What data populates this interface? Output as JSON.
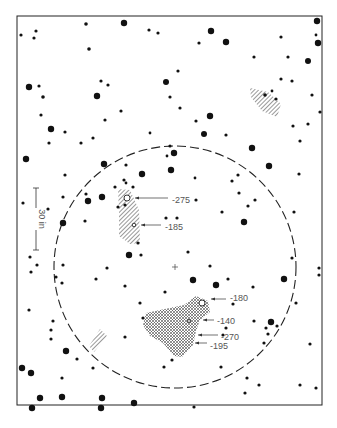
{
  "figure": {
    "frame": {
      "x": 17,
      "y": 16,
      "width": 305,
      "height": 389
    },
    "field_circle": {
      "cx": 175,
      "cy": 267,
      "r": 121
    },
    "center_mark": {
      "x": 175,
      "y": 267
    },
    "scale_bar": {
      "x": 36,
      "y1": 188,
      "y2": 250,
      "label": "30 in"
    },
    "hatched_regions": [
      {
        "name": "upper-right-patch",
        "style": "diagonal",
        "points": "250,88 268,92 281,104 277,117 262,111 251,97"
      },
      {
        "name": "left-streak",
        "style": "diagonal",
        "points": "118,189 130,190 139,210 140,243 130,244 119,236 119,212"
      },
      {
        "name": "lower-left-patch",
        "style": "diagonal",
        "points": "89,346 100,329 107,336 94,352"
      },
      {
        "name": "lower-center-region",
        "style": "crosshatch",
        "points": "146,313 160,310 184,305 196,296 208,301 210,312 200,320 196,331 193,345 182,357 174,356 163,343 150,336 143,325"
      }
    ],
    "annotations": [
      {
        "label": "-275",
        "tx": 172,
        "ty": 200,
        "ax": 127,
        "ay": 198,
        "lx1": 135,
        "lx2": 168
      },
      {
        "label": "-185",
        "tx": 165,
        "ty": 227,
        "ax": 135,
        "ay": 225,
        "lx1": 141,
        "lx2": 161
      },
      {
        "label": "-180",
        "tx": 230,
        "ty": 298,
        "ax": 207,
        "ay": 299,
        "lx1": 211,
        "lx2": 226
      },
      {
        "label": "-140",
        "tx": 217,
        "ty": 321,
        "ax": 201,
        "ay": 320,
        "lx1": 203,
        "lx2": 214
      },
      {
        "label": "-270",
        "tx": 221,
        "ty": 337,
        "ax": 196,
        "ay": 335,
        "lx1": 198,
        "lx2": 218
      },
      {
        "label": "-195",
        "tx": 210,
        "ty": 346,
        "ax": 193,
        "ay": 343,
        "lx1": 195,
        "lx2": 207
      }
    ],
    "open_circles": [
      {
        "x": 127,
        "y": 198,
        "r": 3
      },
      {
        "x": 134,
        "y": 225,
        "r": 1.8
      },
      {
        "x": 202,
        "y": 303,
        "r": 3
      },
      {
        "x": 189,
        "y": 321,
        "r": 1.5
      }
    ],
    "stars": [
      [
        86,
        24,
        1.8
      ],
      [
        124,
        23,
        3.2
      ],
      [
        149,
        30,
        1.6
      ],
      [
        158,
        33,
        1.6
      ],
      [
        21,
        35,
        1.6
      ],
      [
        36,
        31,
        1.6
      ],
      [
        34,
        38,
        1.6
      ],
      [
        211,
        31,
        3.2
      ],
      [
        199,
        43,
        1.6
      ],
      [
        226,
        42,
        3.2
      ],
      [
        89,
        49,
        1.8
      ],
      [
        317,
        21,
        3.2
      ],
      [
        316,
        35,
        1.4
      ],
      [
        318,
        43,
        3.2
      ],
      [
        281,
        37,
        1.6
      ],
      [
        254,
        57,
        1.6
      ],
      [
        288,
        57,
        1.6
      ],
      [
        308,
        61,
        3
      ],
      [
        29,
        87,
        3.2
      ],
      [
        39,
        86,
        1.6
      ],
      [
        43,
        97,
        1.8
      ],
      [
        97,
        96,
        3.2
      ],
      [
        101,
        81,
        1.6
      ],
      [
        108,
        85,
        1.6
      ],
      [
        166,
        82,
        3
      ],
      [
        178,
        71,
        1.6
      ],
      [
        170,
        97,
        1.6
      ],
      [
        281,
        79,
        1.6
      ],
      [
        292,
        81,
        1.6
      ],
      [
        265,
        95,
        1.8
      ],
      [
        272,
        91,
        1.4
      ],
      [
        276,
        99,
        1.6
      ],
      [
        312,
        95,
        1.6
      ],
      [
        320,
        112,
        1.6
      ],
      [
        41,
        115,
        1.6
      ],
      [
        121,
        111,
        1.6
      ],
      [
        105,
        120,
        1.6
      ],
      [
        180,
        108,
        1.6
      ],
      [
        210,
        116,
        3.2
      ],
      [
        196,
        121,
        1.6
      ],
      [
        51,
        129,
        3.2
      ],
      [
        65,
        132,
        1.6
      ],
      [
        49,
        143,
        1.6
      ],
      [
        81,
        143,
        1.6
      ],
      [
        93,
        138,
        1.6
      ],
      [
        150,
        133,
        1.4
      ],
      [
        204,
        134,
        3
      ],
      [
        226,
        135,
        1.6
      ],
      [
        293,
        126,
        1.6
      ],
      [
        308,
        124,
        1.6
      ],
      [
        300,
        141,
        1.6
      ],
      [
        26,
        159,
        3.2
      ],
      [
        170,
        146,
        1.6
      ],
      [
        174,
        153,
        3.2
      ],
      [
        167,
        156,
        1.4
      ],
      [
        252,
        148,
        3.2
      ],
      [
        104,
        164,
        3.2
      ],
      [
        126,
        165,
        1.6
      ],
      [
        142,
        174,
        3.2
      ],
      [
        171,
        170,
        3.2
      ],
      [
        269,
        166,
        3.2
      ],
      [
        65,
        175,
        1.6
      ],
      [
        195,
        178,
        1.4
      ],
      [
        232,
        181,
        1.6
      ],
      [
        238,
        175,
        1.6
      ],
      [
        299,
        174,
        1.6
      ],
      [
        124,
        180,
        1.6
      ],
      [
        126,
        183,
        1.4
      ],
      [
        133,
        187,
        1.6
      ],
      [
        115,
        187,
        1.6
      ],
      [
        86,
        194,
        1.6
      ],
      [
        88,
        201,
        3.2
      ],
      [
        102,
        197,
        3.2
      ],
      [
        63,
        197,
        1.6
      ],
      [
        23,
        203,
        1.6
      ],
      [
        48,
        209,
        1.6
      ],
      [
        118,
        207,
        1.6
      ],
      [
        125,
        205,
        1.6
      ],
      [
        196,
        200,
        1.6
      ],
      [
        239,
        193,
        1.6
      ],
      [
        255,
        200,
        1.6
      ],
      [
        248,
        206,
        1.6
      ],
      [
        222,
        212,
        1.6
      ],
      [
        85,
        221,
        1.6
      ],
      [
        63,
        223,
        3.2
      ],
      [
        166,
        218,
        1.6
      ],
      [
        177,
        218,
        1.6
      ],
      [
        244,
        222,
        3.2
      ],
      [
        294,
        212,
        1.6
      ],
      [
        138,
        243,
        1.6
      ],
      [
        129,
        255,
        3.2
      ],
      [
        141,
        255,
        1.6
      ],
      [
        188,
        252,
        1.6
      ],
      [
        30,
        257,
        1.6
      ],
      [
        37,
        265,
        1.6
      ],
      [
        63,
        265,
        1.6
      ],
      [
        107,
        268,
        1.6
      ],
      [
        210,
        266,
        1.6
      ],
      [
        292,
        258,
        1.6
      ],
      [
        31,
        272,
        1.6
      ],
      [
        56,
        277,
        1.6
      ],
      [
        62,
        283,
        1.6
      ],
      [
        96,
        279,
        1.6
      ],
      [
        193,
        280,
        3.2
      ],
      [
        216,
        285,
        3.2
      ],
      [
        228,
        279,
        1.6
      ],
      [
        284,
        279,
        3.2
      ],
      [
        319,
        268,
        1.6
      ],
      [
        319,
        275,
        1.6
      ],
      [
        125,
        286,
        1.6
      ],
      [
        165,
        292,
        1.6
      ],
      [
        253,
        287,
        1.6
      ],
      [
        140,
        303,
        1.6
      ],
      [
        233,
        304,
        1.6
      ],
      [
        296,
        303,
        1.6
      ],
      [
        29,
        310,
        1.6
      ],
      [
        143,
        318,
        1.6
      ],
      [
        53,
        321,
        1.6
      ],
      [
        254,
        321,
        1.6
      ],
      [
        271,
        322,
        3.2
      ],
      [
        266,
        328,
        1.6
      ],
      [
        277,
        326,
        1.6
      ],
      [
        51,
        330,
        1.6
      ],
      [
        223,
        335,
        1.6
      ],
      [
        226,
        328,
        1.6
      ],
      [
        268,
        334,
        1.6
      ],
      [
        125,
        337,
        1.6
      ],
      [
        51,
        339,
        1.6
      ],
      [
        264,
        343,
        1.6
      ],
      [
        310,
        344,
        1.6
      ],
      [
        66,
        351,
        3.2
      ],
      [
        77,
        359,
        1.6
      ],
      [
        172,
        360,
        1.6
      ],
      [
        22,
        368,
        3.2
      ],
      [
        31,
        373,
        3.2
      ],
      [
        93,
        368,
        1.6
      ],
      [
        164,
        367,
        1.6
      ],
      [
        221,
        367,
        1.6
      ],
      [
        62,
        378,
        1.6
      ],
      [
        247,
        378,
        1.6
      ],
      [
        259,
        385,
        1.6
      ],
      [
        300,
        385,
        1.6
      ],
      [
        316,
        388,
        1.6
      ],
      [
        40,
        398,
        3.2
      ],
      [
        62,
        397,
        3.2
      ],
      [
        102,
        398,
        3.2
      ],
      [
        134,
        403,
        3.2
      ],
      [
        245,
        393,
        1.6
      ],
      [
        32,
        408,
        3.2
      ],
      [
        101,
        408,
        3.2
      ],
      [
        194,
        407,
        1.6
      ]
    ]
  }
}
